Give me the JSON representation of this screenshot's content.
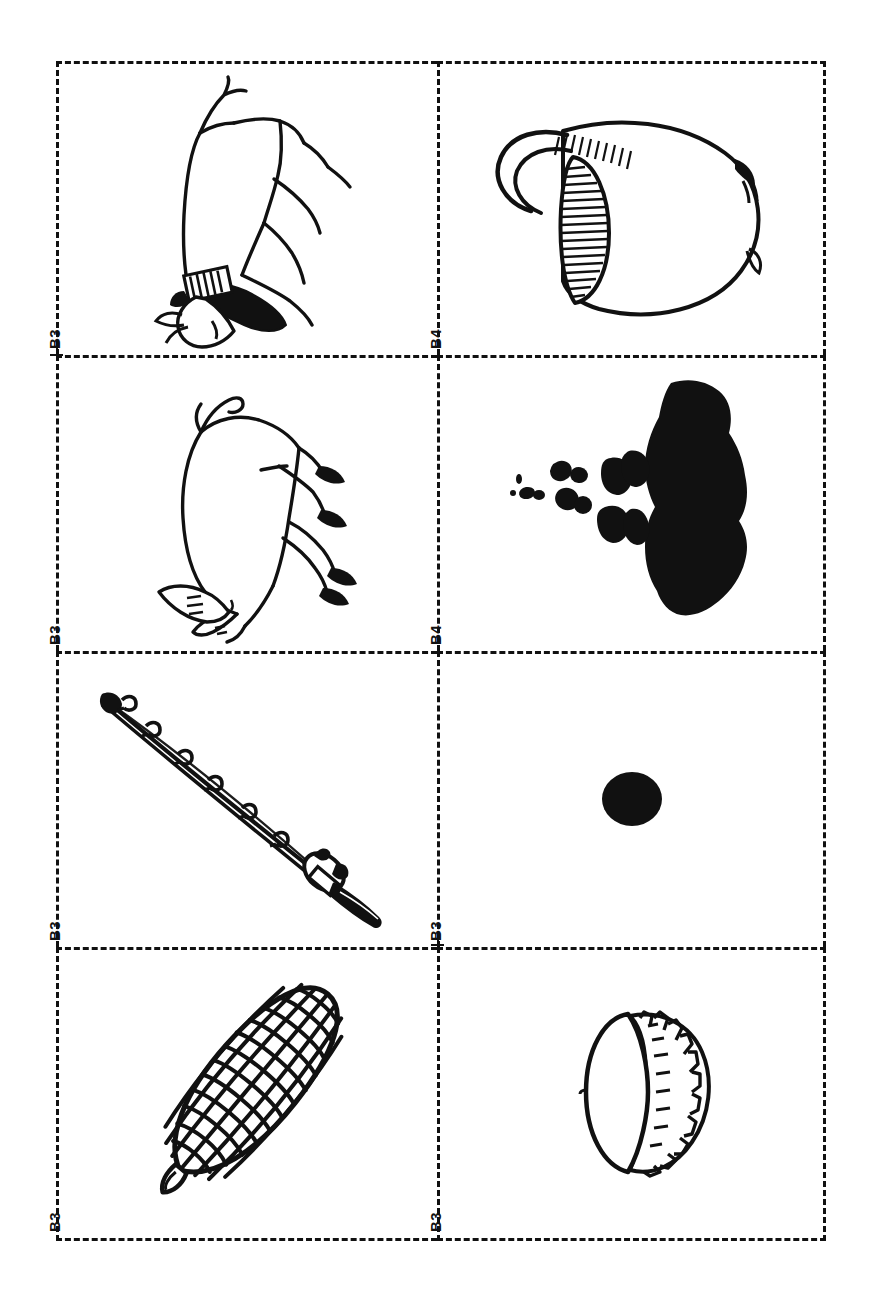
{
  "page": {
    "kind": "picture-card-sheet",
    "orientation": "landscape-content-on-portrait-page",
    "background_color": "#ffffff",
    "ink_color": "#111111",
    "grid": {
      "columns": 2,
      "rows": 4,
      "border_style": "dashed"
    }
  },
  "cards": [
    {
      "index": 1,
      "label": "B3",
      "picture_name": "goat-with-collar",
      "description": "line drawing of a goat standing in profile wearing a dark hatched collar",
      "fill": "outline-with-black-accents"
    },
    {
      "index": 2,
      "label": "B4",
      "picture_name": "jug-with-handle",
      "description": "line drawing of a rounded jug or pitcher with a loop handle and hatched shading",
      "fill": "outline-with-hatching"
    },
    {
      "index": 3,
      "label": "B3",
      "picture_name": "pig",
      "description": "line drawing of a pig standing in profile with large ear and dark hooves",
      "fill": "outline-with-black-accents"
    },
    {
      "index": 4,
      "label": "B4",
      "picture_name": "ink-blot-spill",
      "description": "solid black irregular blob with a trail of small black specks",
      "fill": "solid-black"
    },
    {
      "index": 5,
      "label": "B3",
      "picture_name": "fishing-rod",
      "description": "line drawing of a fishing rod with line guides and a reel at the handle",
      "fill": "outline-with-black-accents"
    },
    {
      "index": 6,
      "label": "B3",
      "picture_name": "black-dot",
      "description": "single small solid black circle centred in the card",
      "fill": "solid-black"
    },
    {
      "index": 7,
      "label": "B3",
      "picture_name": "corn-on-the-cob",
      "description": "line drawing of an ear of corn with kernels in a diagonal grid and a stalk tip",
      "fill": "outline"
    },
    {
      "index": 8,
      "label": "B3",
      "picture_name": "bottle-cap",
      "description": "line drawing of a crimped bottle cap seen at an oblique angle",
      "fill": "outline"
    }
  ]
}
